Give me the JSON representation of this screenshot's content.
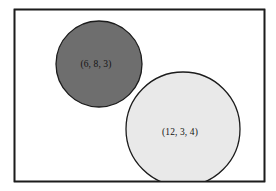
{
  "figure": {
    "canvas": {
      "width": 276,
      "height": 191,
      "background": "#ffffff"
    },
    "frame": {
      "name": "bounding-rectangle",
      "x": 14.5,
      "y": 9.5,
      "width": 250,
      "height": 172,
      "fill": "#ffffff",
      "stroke": "#1c1c1c",
      "stroke_width": 1.6
    },
    "circles": [
      {
        "id": "circle-dark",
        "label": "(6, 8, 3)",
        "values": [
          6,
          8,
          3
        ],
        "cx": 99,
        "cy": 64,
        "r": 43,
        "fill": "#6e6e6e",
        "stroke": "#1c1c1c",
        "stroke_width": 1.3,
        "label_color": "#141414",
        "label_x": 96,
        "label_y": 65
      },
      {
        "id": "circle-light",
        "label": "(12, 3, 4)",
        "values": [
          12,
          3,
          4
        ],
        "cx": 183,
        "cy": 129,
        "r": 57,
        "fill": "#e9e9e9",
        "stroke": "#1c1c1c",
        "stroke_width": 1.3,
        "label_color": "#141414",
        "label_x": 180,
        "label_y": 133
      }
    ]
  }
}
